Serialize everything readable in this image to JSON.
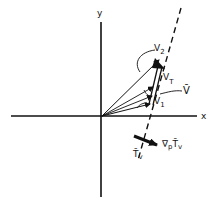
{
  "diagram": {
    "type": "vector-diagram",
    "colors": {
      "ink": "#111111",
      "background": "#ffffff"
    },
    "axes": {
      "x_label": "x",
      "y_label": "y"
    },
    "labels": {
      "v2": "V",
      "v2_sub": "2",
      "vt": "V",
      "vt_sub": "T",
      "vbar": "V̄",
      "v1": "V",
      "v1_sub": "1",
      "isotherm": "T̄",
      "isotherm_sub": "v",
      "gradient": "∇",
      "gradient_sub_p": "p",
      "gradient_T": "T̄",
      "gradient_sub_v": "v"
    },
    "elements": [
      {
        "id": "V1",
        "kind": "vector",
        "from": "origin",
        "to": "V1 tip"
      },
      {
        "id": "V2",
        "kind": "vector",
        "from": "origin",
        "to": "V2 tip"
      },
      {
        "id": "VT",
        "kind": "thermal-wind-vector",
        "from": "V1 tip",
        "to": "V2 tip",
        "style": "bold double arrow"
      },
      {
        "id": "Vbar",
        "kind": "mean-wind-vector",
        "from": "origin",
        "to": "midpoint of VT"
      },
      {
        "id": "Tv",
        "kind": "isotherm",
        "style": "dashed"
      },
      {
        "id": "gradT",
        "kind": "gradient-arrow",
        "style": "bold"
      }
    ]
  }
}
